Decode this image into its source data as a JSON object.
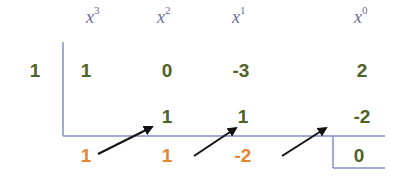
{
  "colors": {
    "coefficient": "#4f6228",
    "result": "#e4872e",
    "lines": "#8090c8",
    "arrows": "#111111",
    "headers": "#6a6a9a"
  },
  "headers": [
    {
      "base": "x",
      "exp": "3"
    },
    {
      "base": "x",
      "exp": "2"
    },
    {
      "base": "x",
      "exp": "1"
    },
    {
      "base": "x",
      "exp": "0"
    }
  ],
  "divisor": "1",
  "coefficients": [
    "1",
    "0",
    "-3",
    "2"
  ],
  "products": [
    "1",
    "1",
    "-2"
  ],
  "results": [
    "1",
    "1",
    "-2"
  ],
  "remainder": "0"
}
